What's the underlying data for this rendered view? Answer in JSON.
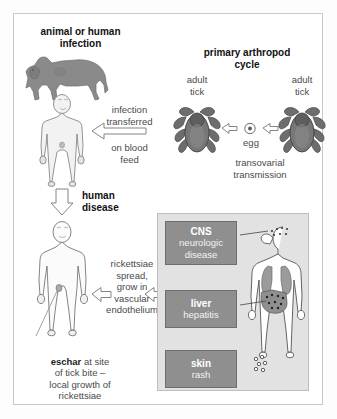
{
  "diagram": {
    "outer_border_color": "#c8c8c8",
    "panel_bg": "#e2e2e2",
    "box_fill": "#8f8f8f",
    "silhouette_fill": "#8a8a8a"
  },
  "labels": {
    "animal_or_human_infection": "animal or human\ninfection",
    "primary_arthropod_cycle": "primary arthropod\ncycle",
    "adult_tick_left": "adult\ntick",
    "adult_tick_right": "adult\ntick",
    "egg": "egg",
    "transovarial_transmission": "transovarial\ntransmission",
    "infection_transferred": "infection\ntransferred",
    "on_blood_feed": "on blood\nfeed",
    "human_disease": "human\ndisease",
    "rickettsiae_spread": "rickettsiae\nspread,\ngrow in\nvascular\nendothelium",
    "eschar_bold": "eschar",
    "eschar_rest": " at site\nof tick bite –\nlocal growth of\nrickettsiae"
  },
  "organ_boxes": [
    {
      "name": "cns",
      "title": "CNS",
      "subtitle": "neurologic\ndisease"
    },
    {
      "name": "liver",
      "title": "liver",
      "subtitle": "hepatitis"
    },
    {
      "name": "skin",
      "title": "skin",
      "subtitle": "rash"
    }
  ],
  "icons": {
    "dog": "dog-silhouette-icon",
    "human_infected": "human-body-icon",
    "human_disease": "human-body-icon",
    "tick_left": "tick-icon",
    "tick_right": "tick-icon",
    "egg": "egg-icon",
    "anatomy": "human-anatomy-organs-icon",
    "arrow_left": "arrow-left-icon",
    "arrow_down": "arrow-down-icon",
    "arrow_right": "arrow-right-icon"
  }
}
